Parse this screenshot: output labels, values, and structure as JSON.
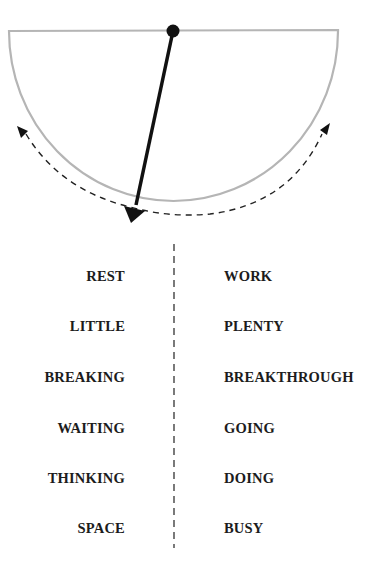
{
  "diagram": {
    "type": "pendulum",
    "bowl_color": "#b5b5b5",
    "pendulum_color": "#111111",
    "swing_arrow_style": "dashed",
    "swing_arrow_color": "#222222",
    "pendulum_angle_deg": 14
  },
  "columns": {
    "left": [
      "REST",
      "LITTLE",
      "BREAKING",
      "WAITING",
      "THINKING",
      "SPACE"
    ],
    "right": [
      "WORK",
      "PLENTY",
      "BREAKTHROUGH",
      "GOING",
      "DOING",
      "BUSY"
    ]
  },
  "divider": {
    "style": "dashed",
    "color": "#333333"
  }
}
